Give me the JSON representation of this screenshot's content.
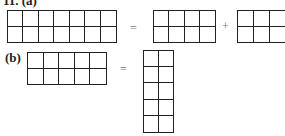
{
  "problem": {
    "number_label": "11. (a)",
    "part_a": {
      "label": "(a)",
      "left": {
        "cols": 7,
        "rows": 2
      },
      "equals": "=",
      "right1": {
        "cols": 4,
        "rows": 2
      },
      "plus": "+",
      "right2": {
        "cols": 3,
        "rows": 2
      }
    },
    "part_b": {
      "label": "(b)",
      "left": {
        "cols": 5,
        "rows": 2
      },
      "equals": "=",
      "right": {
        "cols": 2,
        "rows": 5
      }
    }
  }
}
